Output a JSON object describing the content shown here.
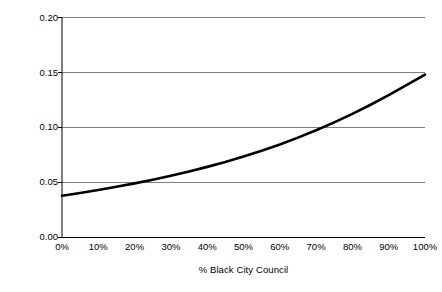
{
  "chart_data": {
    "type": "line",
    "title": "",
    "xlabel": "% Black City Council",
    "ylabel": "Predicting Takeover",
    "xlim": [
      0,
      100
    ],
    "ylim": [
      0.0,
      0.2
    ],
    "grid": true,
    "legend": false,
    "xtick_labels": [
      "0%",
      "10%",
      "20%",
      "30%",
      "40%",
      "50%",
      "60%",
      "70%",
      "80%",
      "90%",
      "100%"
    ],
    "xtick_values": [
      0,
      10,
      20,
      30,
      40,
      50,
      60,
      70,
      80,
      90,
      100
    ],
    "ytick_labels": [
      "0.00",
      "0.05",
      "0.10",
      "0.15",
      "0.20"
    ],
    "ytick_values": [
      0.0,
      0.05,
      0.1,
      0.15,
      0.2
    ],
    "line_color": "#000000",
    "line_width": 2.6,
    "grid_color": "#808080",
    "axis_color": "#000000",
    "series": [
      {
        "name": "Predicted probability of takeover",
        "x": [
          0,
          5,
          10,
          15,
          20,
          25,
          30,
          35,
          40,
          45,
          50,
          55,
          60,
          65,
          70,
          75,
          80,
          85,
          90,
          95,
          100
        ],
        "values": [
          0.038,
          0.0405,
          0.0432,
          0.0461,
          0.0492,
          0.0525,
          0.0561,
          0.06,
          0.0642,
          0.0687,
          0.0736,
          0.0789,
          0.0846,
          0.0908,
          0.0975,
          0.1047,
          0.1124,
          0.1207,
          0.1295,
          0.1388,
          0.148
        ]
      }
    ]
  }
}
